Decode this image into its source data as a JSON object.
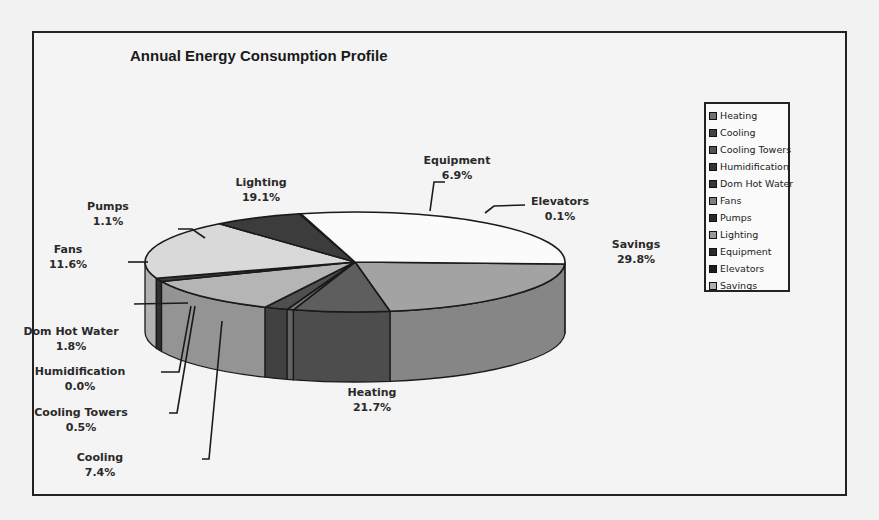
{
  "chart_data": {
    "type": "pie",
    "title": "Annual Energy Consumption Profile",
    "three_d": true,
    "legend_position": "right",
    "categories": [
      "Heating",
      "Cooling",
      "Cooling Towers",
      "Humidification",
      "Dom Hot Water",
      "Fans",
      "Pumps",
      "Lighting",
      "Equipment",
      "Elevators",
      "Savings"
    ],
    "values": [
      21.7,
      7.4,
      0.5,
      0.0,
      1.8,
      11.6,
      1.1,
      19.1,
      6.9,
      0.1,
      29.8
    ],
    "value_labels": [
      "21.7%",
      "7.4%",
      "0.5%",
      "0.0%",
      "1.8%",
      "11.6%",
      "1.1%",
      "19.1%",
      "6.9%",
      "0.1%",
      "29.8%"
    ],
    "unit": "%"
  },
  "colors": {
    "Heating": "#a3a3a3",
    "Cooling": "#5e5e5e",
    "Cooling Towers": "#777777",
    "Humidification": "#4a4a4a",
    "Dom Hot Water": "#4f4f4f",
    "Fans": "#b5b5b5",
    "Pumps": "#3a3a3a",
    "Lighting": "#d9d9d9",
    "Equipment": "#3c3c3c",
    "Elevators": "#2a2a2a",
    "Savings": "#fbfbfb"
  },
  "labels": [
    {
      "name": "Heating",
      "x": 372,
      "y": 396,
      "tx": 372,
      "ty": 396,
      "anchor": "middle"
    },
    {
      "name": "Cooling",
      "x": 100,
      "y": 461,
      "anchor": "middle"
    },
    {
      "name": "Cooling Towers",
      "x": 81,
      "y": 416,
      "anchor": "middle"
    },
    {
      "name": "Humidification",
      "x": 80,
      "y": 375,
      "anchor": "middle"
    },
    {
      "name": "Dom Hot Water",
      "x": 71,
      "y": 335,
      "anchor": "middle"
    },
    {
      "name": "Fans",
      "x": 68,
      "y": 253,
      "anchor": "middle"
    },
    {
      "name": "Pumps",
      "x": 108,
      "y": 210,
      "anchor": "middle"
    },
    {
      "name": "Lighting",
      "x": 261,
      "y": 186,
      "anchor": "middle"
    },
    {
      "name": "Equipment",
      "x": 457,
      "y": 164,
      "anchor": "middle"
    },
    {
      "name": "Elevators",
      "x": 560,
      "y": 205,
      "anchor": "middle"
    },
    {
      "name": "Savings",
      "x": 636,
      "y": 248,
      "anchor": "middle"
    }
  ],
  "leaders": [
    "M134,304 L188,303",
    "M161,372 L179,372 L191,306",
    "M169,413 L177,413 L195,306",
    "M202,459 L209,459 L222,321",
    "M178,229 L192,229 L205,238",
    "M128,262 L148,262",
    "M445,182 L434,182 L430,211",
    "M525,205 L494,206 L485,213"
  ]
}
